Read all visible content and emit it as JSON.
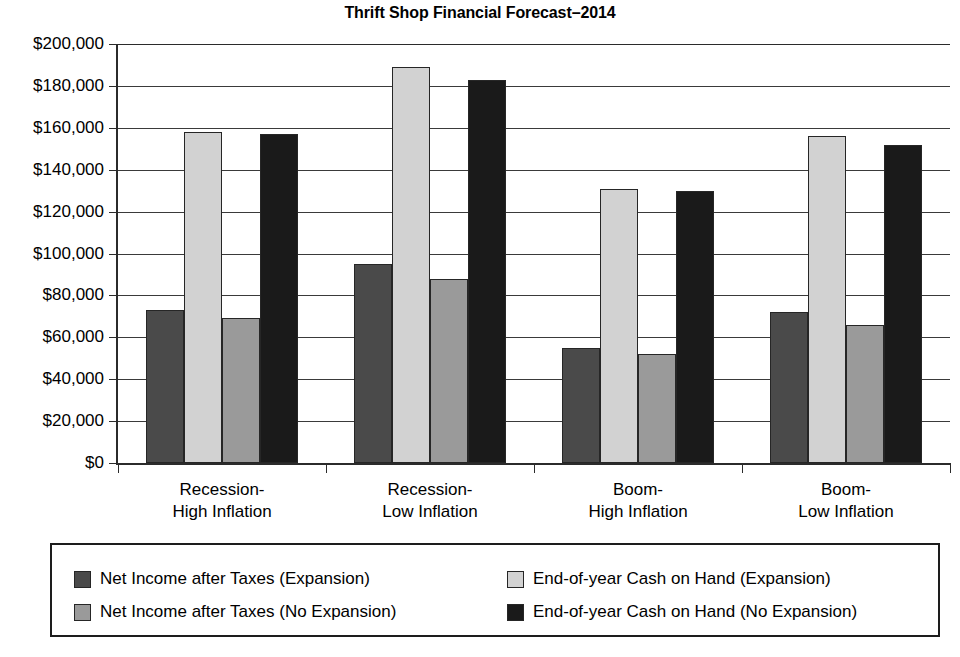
{
  "chart_data": {
    "type": "bar",
    "title": "Thrift Shop Financial Forecast–2014",
    "xlabel": "",
    "ylabel": "",
    "ylim": [
      0,
      200000
    ],
    "grid": true,
    "legend_position": "bottom",
    "categories": [
      "Recession-\nHigh Inflation",
      "Recession-\nLow Inflation",
      "Boom-\nHigh Inflation",
      "Boom-\nLow Inflation"
    ],
    "ytick_labels": [
      "$200,000",
      "$180,000",
      "$160,000",
      "$140,000",
      "$120,000",
      "$100,000",
      "$80,000",
      "$60,000",
      "$40,000",
      "$20,000",
      "$0"
    ],
    "ytick_values": [
      200000,
      180000,
      160000,
      140000,
      120000,
      100000,
      80000,
      60000,
      40000,
      20000,
      0
    ],
    "series": [
      {
        "name": "Net Income after Taxes (Expansion)",
        "color": "#4a4a4a",
        "values": [
          73000,
          95000,
          55000,
          72000
        ]
      },
      {
        "name": "End-of-year Cash on Hand (Expansion)",
        "color": "#d2d2d2",
        "values": [
          158000,
          189000,
          131000,
          156000
        ]
      },
      {
        "name": "Net Income after Taxes (No Expansion)",
        "color": "#9a9a9a",
        "values": [
          69000,
          88000,
          52000,
          66000
        ]
      },
      {
        "name": "End-of-year Cash on Hand (No Expansion)",
        "color": "#1a1a1a",
        "values": [
          157000,
          183000,
          130000,
          152000
        ]
      }
    ]
  }
}
